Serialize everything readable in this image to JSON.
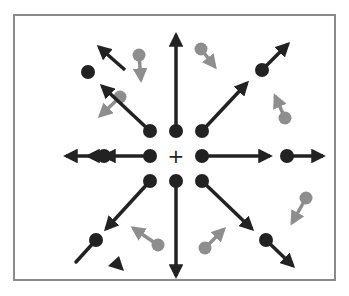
{
  "diagram": {
    "colors": {
      "background": "#ffffff",
      "border": "#8a8a8a",
      "primary": "#222222",
      "secondary": "#8e8e8e"
    },
    "frame": {
      "x": 14,
      "y": 15,
      "w": 321,
      "h": 265
    },
    "center_marker": {
      "x": 176,
      "y": 156,
      "symbol": "+"
    },
    "black_dots": [
      {
        "x": 150,
        "y": 131
      },
      {
        "x": 176,
        "y": 131
      },
      {
        "x": 202,
        "y": 131
      },
      {
        "x": 150,
        "y": 156
      },
      {
        "x": 202,
        "y": 156
      },
      {
        "x": 150,
        "y": 181
      },
      {
        "x": 176,
        "y": 181
      },
      {
        "x": 202,
        "y": 181
      },
      {
        "x": 104,
        "y": 156
      },
      {
        "x": 287,
        "y": 156
      },
      {
        "x": 88,
        "y": 72
      },
      {
        "x": 262,
        "y": 70
      },
      {
        "x": 96,
        "y": 240
      },
      {
        "x": 266,
        "y": 240
      }
    ],
    "black_arrows": [
      {
        "name": "north",
        "x1": 176,
        "y1": 131,
        "x2": 176,
        "y2": 35
      },
      {
        "name": "south",
        "x1": 176,
        "y1": 181,
        "x2": 176,
        "y2": 276
      },
      {
        "name": "east-inner",
        "x1": 202,
        "y1": 156,
        "x2": 270,
        "y2": 156
      },
      {
        "name": "east-outer",
        "x1": 287,
        "y1": 156,
        "x2": 323,
        "y2": 156
      },
      {
        "name": "west-inner",
        "x1": 150,
        "y1": 156,
        "x2": 104,
        "y2": 156
      },
      {
        "name": "west-outer-a",
        "x1": 104,
        "y1": 156,
        "x2": 88,
        "y2": 156
      },
      {
        "name": "west-outer-b",
        "x1": 88,
        "y1": 156,
        "x2": 66,
        "y2": 156
      },
      {
        "name": "northeast-inner",
        "x1": 202,
        "y1": 131,
        "x2": 247,
        "y2": 83
      },
      {
        "name": "northeast-outer",
        "x1": 262,
        "y1": 70,
        "x2": 288,
        "y2": 44
      },
      {
        "name": "northwest-inner",
        "x1": 150,
        "y1": 131,
        "x2": 102,
        "y2": 86
      },
      {
        "name": "northwest-detached",
        "x1": 125,
        "y1": 70,
        "x2": 99,
        "y2": 47
      },
      {
        "name": "southeast-inner",
        "x1": 202,
        "y1": 181,
        "x2": 252,
        "y2": 229
      },
      {
        "name": "southeast-outer",
        "x1": 266,
        "y1": 240,
        "x2": 293,
        "y2": 266
      },
      {
        "name": "southwest-inner",
        "x1": 150,
        "y1": 181,
        "x2": 106,
        "y2": 229
      }
    ],
    "black_stubs": [
      {
        "name": "southwest-outer-stub",
        "x1": 96,
        "y1": 240,
        "x2": 76,
        "y2": 262
      }
    ],
    "black_triangles": [
      {
        "name": "detached-head",
        "points": "108,266 124,271 119,256"
      }
    ],
    "gray_vectors": [
      {
        "x": 139,
        "y": 55,
        "x2": 141,
        "y2": 80
      },
      {
        "x": 201,
        "y": 49,
        "x2": 215,
        "y2": 67
      },
      {
        "x": 120,
        "y": 97,
        "x2": 100,
        "y2": 116
      },
      {
        "x": 285,
        "y": 118,
        "x2": 275,
        "y2": 96
      },
      {
        "x": 306,
        "y": 198,
        "x2": 292,
        "y2": 223
      },
      {
        "x": 158,
        "y": 245,
        "x2": 133,
        "y2": 228
      },
      {
        "x": 205,
        "y": 248,
        "x2": 224,
        "y2": 229
      }
    ]
  }
}
